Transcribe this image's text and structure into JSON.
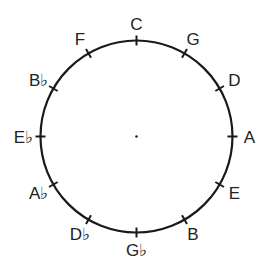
{
  "circle": {
    "cx": 136.5,
    "cy": 136.5,
    "r": 96,
    "stroke": "#1a1a1a",
    "stroke_width": 2.2
  },
  "center_dot": true,
  "labels": [
    {
      "note": "C",
      "angle": 0
    },
    {
      "note": "G",
      "angle": 30
    },
    {
      "note": "D",
      "angle": 60
    },
    {
      "note": "A",
      "angle": 90
    },
    {
      "note": "E",
      "angle": 120
    },
    {
      "note": "B",
      "angle": 150
    },
    {
      "note": "G♭",
      "angle": 180
    },
    {
      "note": "D♭",
      "angle": 210
    },
    {
      "note": "A♭",
      "angle": 240
    },
    {
      "note": "E♭",
      "angle": 270
    },
    {
      "note": "B♭",
      "angle": 300
    },
    {
      "note": "F",
      "angle": 330
    }
  ]
}
